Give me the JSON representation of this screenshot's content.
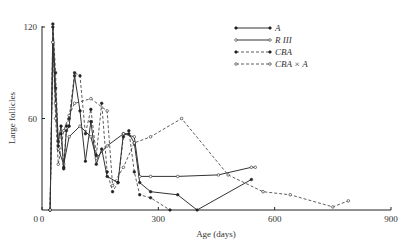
{
  "chart_data": {
    "type": "line",
    "title": "",
    "xlabel": "Age (days)",
    "ylabel": "Large follicles",
    "xlim": [
      0,
      900
    ],
    "ylim": [
      0,
      125
    ],
    "xticks": [
      0,
      300,
      600,
      900
    ],
    "yticks": [
      60,
      120
    ],
    "xtick_labels": [
      "0",
      "300",
      "600",
      "900"
    ],
    "ytick_labels": [
      "60",
      "120"
    ],
    "grid": false,
    "legend_position": "upper right",
    "series": [
      {
        "name": "A",
        "style": "solid",
        "marker": "filled",
        "x": [
          21,
          28,
          35,
          42,
          49,
          56,
          63,
          70,
          84,
          98,
          112,
          126,
          140,
          154,
          168,
          196,
          210,
          224,
          238,
          252,
          280,
          350,
          400,
          540
        ],
        "y": [
          0,
          120,
          80,
          45,
          55,
          27,
          52,
          55,
          88,
          65,
          32,
          58,
          30,
          40,
          22,
          18,
          50,
          50,
          44,
          18,
          12,
          10,
          0,
          20
        ]
      },
      {
        "name": "R III",
        "style": "solid",
        "marker": "open",
        "x": [
          21,
          28,
          35,
          42,
          56,
          70,
          98,
          126,
          140,
          168,
          210,
          238,
          252,
          280,
          350,
          455,
          540,
          550
        ],
        "y": [
          0,
          110,
          70,
          40,
          30,
          48,
          55,
          48,
          34,
          42,
          50,
          48,
          22,
          22,
          22,
          23,
          28,
          28
        ]
      },
      {
        "name": "CBA",
        "style": "dashed",
        "marker": "filled",
        "x": [
          21,
          28,
          35,
          42,
          49,
          56,
          63,
          70,
          84,
          98,
          112,
          126,
          140,
          154,
          168,
          182,
          196,
          210,
          224,
          238,
          252,
          280,
          330
        ],
        "y": [
          0,
          122,
          90,
          42,
          50,
          28,
          55,
          60,
          90,
          88,
          50,
          66,
          36,
          70,
          25,
          12,
          18,
          48,
          52,
          25,
          10,
          8,
          0
        ]
      },
      {
        "name": "CBA × A",
        "style": "dashed",
        "marker": "open",
        "x": [
          21,
          28,
          35,
          42,
          56,
          70,
          84,
          126,
          168,
          182,
          210,
          238,
          280,
          360,
          480,
          570,
          640,
          750,
          790
        ],
        "y": [
          0,
          110,
          60,
          30,
          52,
          62,
          70,
          73,
          65,
          16,
          28,
          44,
          48,
          60,
          23,
          12,
          10,
          2,
          6
        ]
      }
    ]
  },
  "legend": {
    "items": [
      {
        "label": "A"
      },
      {
        "label": "R III"
      },
      {
        "label": "CBA"
      },
      {
        "label": "CBA × A"
      }
    ]
  }
}
